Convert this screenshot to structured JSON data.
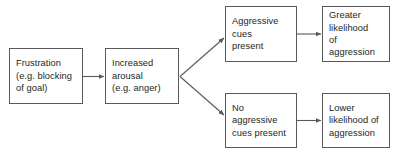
{
  "diagram": {
    "type": "flowchart",
    "title": "",
    "colors": {
      "background": "#ffffff",
      "box_border": "#58595b",
      "text": "#231f20",
      "arrow": "#58595b"
    },
    "nodes": [
      {
        "id": "frustration",
        "label": "Frustration\n(e.g. blocking\nof goal)"
      },
      {
        "id": "arousal",
        "label": "Increased\narousal\n(e.g. anger)"
      },
      {
        "id": "cues_present",
        "label": "Aggressive\ncues\npresent"
      },
      {
        "id": "greater",
        "label": "Greater\nlikelihood\nof aggression"
      },
      {
        "id": "no_cues",
        "label": "No\naggressive\ncues present"
      },
      {
        "id": "lower",
        "label": "Lower\nlikelihood of\naggression"
      }
    ],
    "edges": [
      {
        "from": "frustration",
        "to": "arousal",
        "style": "straight"
      },
      {
        "from": "arousal",
        "to": "cues_present",
        "style": "diagonal-up"
      },
      {
        "from": "arousal",
        "to": "no_cues",
        "style": "diagonal-down"
      },
      {
        "from": "cues_present",
        "to": "greater",
        "style": "straight"
      },
      {
        "from": "no_cues",
        "to": "lower",
        "style": "straight"
      }
    ]
  }
}
